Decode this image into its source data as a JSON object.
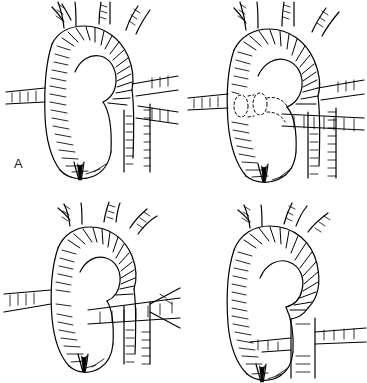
{
  "figure": {
    "kind": "line-art-medical-illustration",
    "technique": "pen-and-ink hatching",
    "ink_color": "#000000",
    "background_color": "#ffffff",
    "width": 367,
    "height": 383,
    "grid": {
      "rows": 2,
      "cols": 2
    }
  },
  "panels": [
    {
      "id": "a",
      "label": "A",
      "description": "Normal aortic arch with three great-vessel branches arising from the superior aspect; ascending aorta at left, arch curving right-to-left, descending aorta behind. Horizontal vessels cross left and right.",
      "branch_count": 3,
      "leftmost_branch_bifurcates": true,
      "has_dashed_hidden_segment": false,
      "aortic_root_valve_visible": true
    },
    {
      "id": "b",
      "label": "B",
      "description": "Arch variant with a retro-positioned vessel indicated by dotted/dashed outlines crossing behind the ascending aorta; wide arch, bulbous aortic root.",
      "branch_count": 3,
      "leftmost_branch_bifurcates": true,
      "has_dashed_hidden_segment": true,
      "aortic_root_valve_visible": true
    },
    {
      "id": "c",
      "label": "C",
      "description": "Narrower, more vertical arch; a horizontal vessel passes in front of the descending aorta with a wedge-shaped branch at right.",
      "branch_count": 3,
      "leftmost_branch_bifurcates": true,
      "has_dashed_hidden_segment": false,
      "aortic_root_valve_visible": true
    },
    {
      "id": "d",
      "label": "D",
      "description": "Tight, sharply hooked arch; branch vessels join the descending aorta lower, forming a cross at right below the arch.",
      "branch_count": 3,
      "leftmost_branch_bifurcates": true,
      "has_dashed_hidden_segment": false,
      "aortic_root_valve_visible": true
    }
  ]
}
